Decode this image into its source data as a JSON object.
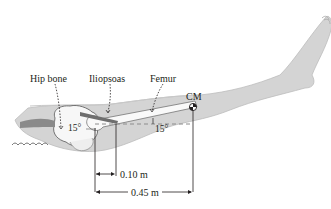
{
  "figure": {
    "labels": {
      "hip_bone": "Hip bone",
      "iliopsoas": "Iliopsoas",
      "femur": "Femur",
      "center_of_mass": "CM"
    },
    "angles": {
      "muscle_angle": "15°",
      "femur_angle": "15°"
    },
    "dimensions": {
      "muscle_attachment_distance": "0.10 m",
      "cm_distance": "0.45 m"
    },
    "colors": {
      "leg_fill": "#d4d4d4",
      "leg_stroke": "#bdbdbd",
      "bone_fill": "#f7f7f7",
      "line": "#231f20",
      "dashed": "#8c8c8c",
      "muscle": "#6e6e6e"
    }
  }
}
